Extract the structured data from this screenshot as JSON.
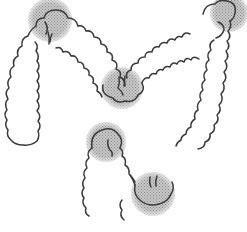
{
  "figure": {
    "background": "#ffffff",
    "outline_color": "#3a3a3a",
    "highlight_color": "#9a9a9a",
    "highlights": [
      {
        "name": "hepatic-flexure-left",
        "cx": 50,
        "cy": 20,
        "r": 22
      },
      {
        "name": "top-right-flexure",
        "cx": 229,
        "cy": 13,
        "r": 19
      },
      {
        "name": "middle-flexure",
        "cx": 122,
        "cy": 88,
        "r": 21
      },
      {
        "name": "lower-left-flexure",
        "cx": 106,
        "cy": 142,
        "r": 20
      },
      {
        "name": "lower-right-flexure",
        "cx": 153,
        "cy": 194,
        "r": 22
      }
    ]
  }
}
